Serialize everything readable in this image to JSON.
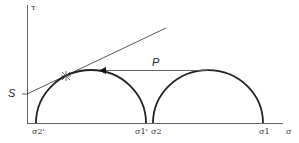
{
  "diagram": {
    "type": "mohr-circles",
    "axes": {
      "y_label": "τ",
      "x_label": "σ"
    },
    "labels": {
      "intercept": "S",
      "translation": "P",
      "sigma2_prime": "σ2'",
      "sigma1_prime": "σ1'",
      "sigma2": "σ2",
      "sigma1": "σ1"
    },
    "colors": {
      "stroke": "#222222",
      "axis": "#555555"
    }
  }
}
